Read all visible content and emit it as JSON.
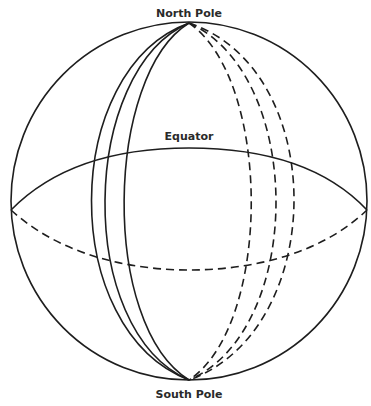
{
  "diagram": {
    "type": "globe-meridians",
    "labels": {
      "north": "North Pole",
      "south": "South Pole",
      "equator": "Equator"
    },
    "sphere": {
      "cx": 189,
      "cy": 201,
      "rx": 178,
      "ry": 179
    },
    "equator_ellipse": {
      "cx": 189,
      "cy": 210,
      "rx": 178,
      "ry": 60
    },
    "poles": {
      "north": [
        189,
        23
      ],
      "south": [
        189,
        380
      ]
    },
    "meridians_front_x_at_equator": [
      58,
      74,
      105
    ],
    "meridians_back_x_at_equator": [
      272,
      305,
      328
    ],
    "colors": {
      "line": "#1e1e1e",
      "background": "#ffffff"
    }
  }
}
